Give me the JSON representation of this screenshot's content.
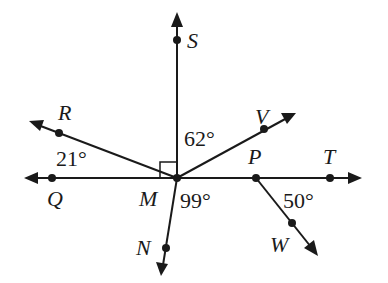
{
  "diagram": {
    "type": "geometry-angles",
    "center_point": "M",
    "points": {
      "S": {
        "label": "S",
        "x": 177,
        "y": 40
      },
      "R": {
        "label": "R",
        "x": 59,
        "y": 133
      },
      "Q": {
        "label": "Q",
        "x": 52,
        "y": 178
      },
      "M": {
        "label": "M",
        "x": 177,
        "y": 178
      },
      "V": {
        "label": "V",
        "x": 264,
        "y": 129
      },
      "P": {
        "label": "P",
        "x": 256,
        "y": 178
      },
      "T": {
        "label": "T",
        "x": 330,
        "y": 178
      },
      "N": {
        "label": "N",
        "x": 166,
        "y": 248
      },
      "W": {
        "label": "W",
        "x": 292,
        "y": 223
      }
    },
    "angles": {
      "QMR": {
        "label": "21°"
      },
      "SMV": {
        "label": "62°"
      },
      "TMN": {
        "label": "99°"
      },
      "TPW": {
        "label": "50°"
      }
    },
    "right_angle_marker": "SMQ",
    "lines": [
      "line QT (horizontal, through Q, M, P, T)",
      "ray MS",
      "ray MR",
      "ray MV",
      "ray MN",
      "ray PW"
    ]
  }
}
